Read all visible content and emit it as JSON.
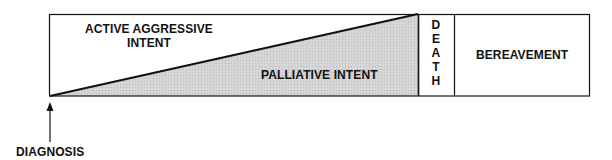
{
  "diagram": {
    "phases": {
      "active": {
        "line1": "ACTIVE AGGRESSIVE",
        "line2": "INTENT"
      },
      "palliative": {
        "label": "PALLIATIVE INTENT"
      },
      "death": {
        "letters": [
          "D",
          "E",
          "A",
          "T",
          "H"
        ]
      },
      "bereavement": {
        "label": "BEREAVEMENT"
      }
    },
    "marker": {
      "label": "DIAGNOSIS"
    },
    "colors": {
      "outline": "#111111",
      "shading": "#d4d4d4",
      "background": "#ffffff"
    }
  }
}
